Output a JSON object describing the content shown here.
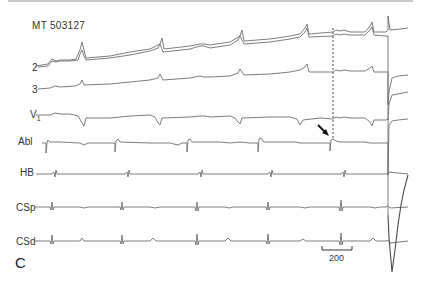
{
  "figure": {
    "record_id": "MT 503127",
    "panel_label": "C",
    "scale_bar": {
      "label": "200",
      "unit_implied": "ms"
    },
    "annotations": {
      "dashed_line": "vertical dashed marker near x≈333",
      "arrow": "arrow pointing to ablation-catheter signal"
    },
    "channels": [
      {
        "id": "lead-1",
        "label": ""
      },
      {
        "id": "lead-2",
        "label": "2"
      },
      {
        "id": "lead-3",
        "label": "3"
      },
      {
        "id": "lead-v1",
        "label": "V1"
      },
      {
        "id": "abl",
        "label": "Abl"
      },
      {
        "id": "hb",
        "label": "HB"
      },
      {
        "id": "csp",
        "label": "CSp"
      },
      {
        "id": "csd",
        "label": "CSd"
      }
    ]
  }
}
